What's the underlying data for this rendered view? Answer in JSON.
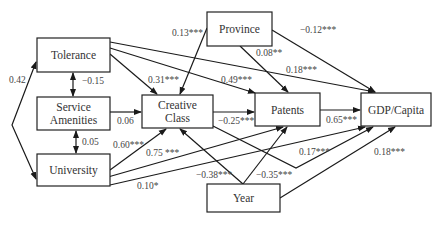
{
  "diagram": {
    "type": "path-model",
    "nodes": [
      {
        "id": "tolerance",
        "label": [
          "Tolerance"
        ],
        "x": 37,
        "y": 38,
        "w": 73,
        "h": 34
      },
      {
        "id": "service",
        "label": [
          "Service",
          "Amenities"
        ],
        "x": 37,
        "y": 97,
        "w": 73,
        "h": 33
      },
      {
        "id": "university",
        "label": [
          "University"
        ],
        "x": 37,
        "y": 154,
        "w": 73,
        "h": 32
      },
      {
        "id": "creative",
        "label": [
          "Creative",
          "Class"
        ],
        "x": 142,
        "y": 95,
        "w": 71,
        "h": 33
      },
      {
        "id": "province",
        "label": [
          "Province"
        ],
        "x": 207,
        "y": 12,
        "w": 65,
        "h": 34
      },
      {
        "id": "patents",
        "label": [
          "Patents"
        ],
        "x": 255,
        "y": 93,
        "w": 65,
        "h": 33
      },
      {
        "id": "gdp",
        "label": [
          "GDP/Capita"
        ],
        "x": 361,
        "y": 93,
        "w": 70,
        "h": 33
      },
      {
        "id": "year",
        "label": [
          "Year"
        ],
        "x": 207,
        "y": 184,
        "w": 73,
        "h": 28
      }
    ],
    "edges": [
      {
        "from": "tolerance",
        "to": "university",
        "label": "0.42",
        "kind": "curved-bidirectional",
        "points": [
          [
            36,
            62
          ],
          [
            12,
            125
          ],
          [
            36,
            179
          ]
        ],
        "lx": 9,
        "ly": 83
      },
      {
        "from": "tolerance",
        "to": "service",
        "label": "−0.15",
        "kind": "bidirectional",
        "points": [
          [
            73,
            73
          ],
          [
            73,
            96
          ]
        ],
        "lx": 82,
        "ly": 84
      },
      {
        "from": "service",
        "to": "university",
        "label": "0.05",
        "kind": "bidirectional",
        "points": [
          [
            76,
            131
          ],
          [
            76,
            153
          ]
        ],
        "lx": 82,
        "ly": 145
      },
      {
        "from": "service",
        "to": "creative",
        "label": "0.06",
        "kind": "arrow",
        "points": [
          [
            110,
            112
          ],
          [
            141,
            112
          ]
        ],
        "lx": 117,
        "ly": 124
      },
      {
        "from": "tolerance",
        "to": "creative",
        "label": "0.31***",
        "kind": "arrow",
        "points": [
          [
            110,
            54
          ],
          [
            157,
            94
          ]
        ],
        "lx": 148,
        "ly": 83
      },
      {
        "from": "tolerance",
        "to": "patents",
        "label": "0.49***",
        "kind": "arrow",
        "points": [
          [
            110,
            48
          ],
          [
            255,
            93
          ]
        ],
        "lx": 221,
        "ly": 83
      },
      {
        "from": "tolerance",
        "to": "gdp",
        "label": "0.18***",
        "kind": "arrow",
        "points": [
          [
            110,
            42
          ],
          [
            375,
            92
          ]
        ],
        "lx": 286,
        "ly": 73
      },
      {
        "from": "province",
        "to": "creative",
        "label": "0.13***",
        "kind": "arrow",
        "points": [
          [
            207,
            28
          ],
          [
            180,
            94
          ]
        ],
        "lx": 172,
        "ly": 36
      },
      {
        "from": "province",
        "to": "patents",
        "label": "0.08**",
        "kind": "arrow",
        "points": [
          [
            240,
            46
          ],
          [
            288,
            92
          ]
        ],
        "lx": 256,
        "ly": 56
      },
      {
        "from": "province",
        "to": "gdp",
        "label": "−0.12***",
        "kind": "arrow",
        "points": [
          [
            272,
            30
          ],
          [
            375,
            92
          ]
        ],
        "lx": 300,
        "ly": 33
      },
      {
        "from": "creative",
        "to": "patents",
        "label": "−0.25***",
        "kind": "arrow",
        "points": [
          [
            213,
            112
          ],
          [
            254,
            112
          ]
        ],
        "lx": 218,
        "ly": 124
      },
      {
        "from": "patents",
        "to": "gdp",
        "label": "0.65***",
        "kind": "arrow",
        "points": [
          [
            320,
            110
          ],
          [
            360,
            110
          ]
        ],
        "lx": 326,
        "ly": 123
      },
      {
        "from": "creative",
        "to": "gdp",
        "label": "0.17***",
        "kind": "bent-arrow",
        "points": [
          [
            213,
            126
          ],
          [
            296,
            168
          ],
          [
            373,
            127
          ]
        ],
        "lx": 299,
        "ly": 155
      },
      {
        "from": "university",
        "to": "creative",
        "label": "0.60***",
        "kind": "arrow",
        "points": [
          [
            110,
            170
          ],
          [
            166,
            129
          ]
        ],
        "lx": 113,
        "ly": 148
      },
      {
        "from": "university",
        "to": "patents",
        "label": "0.75 ***",
        "kind": "arrow",
        "points": [
          [
            108,
            177
          ],
          [
            283,
            127
          ]
        ],
        "lx": 146,
        "ly": 156
      },
      {
        "from": "university",
        "to": "gdp",
        "label": "0.10*",
        "kind": "arrow",
        "points": [
          [
            110,
            185
          ],
          [
            365,
            127
          ]
        ],
        "lx": 137,
        "ly": 189
      },
      {
        "from": "year",
        "to": "creative",
        "label": "−0.38***",
        "kind": "arrow",
        "points": [
          [
            243,
            184
          ],
          [
            180,
            129
          ]
        ],
        "lx": 196,
        "ly": 178
      },
      {
        "from": "year",
        "to": "patents",
        "label": "−0.35***",
        "kind": "arrow",
        "points": [
          [
            243,
            184
          ],
          [
            287,
            127
          ]
        ],
        "lx": 256,
        "ly": 178
      },
      {
        "from": "year",
        "to": "gdp",
        "label": "0.18***",
        "kind": "arrow",
        "points": [
          [
            280,
            198
          ],
          [
            395,
            127
          ]
        ],
        "lx": 374,
        "ly": 155
      }
    ]
  }
}
